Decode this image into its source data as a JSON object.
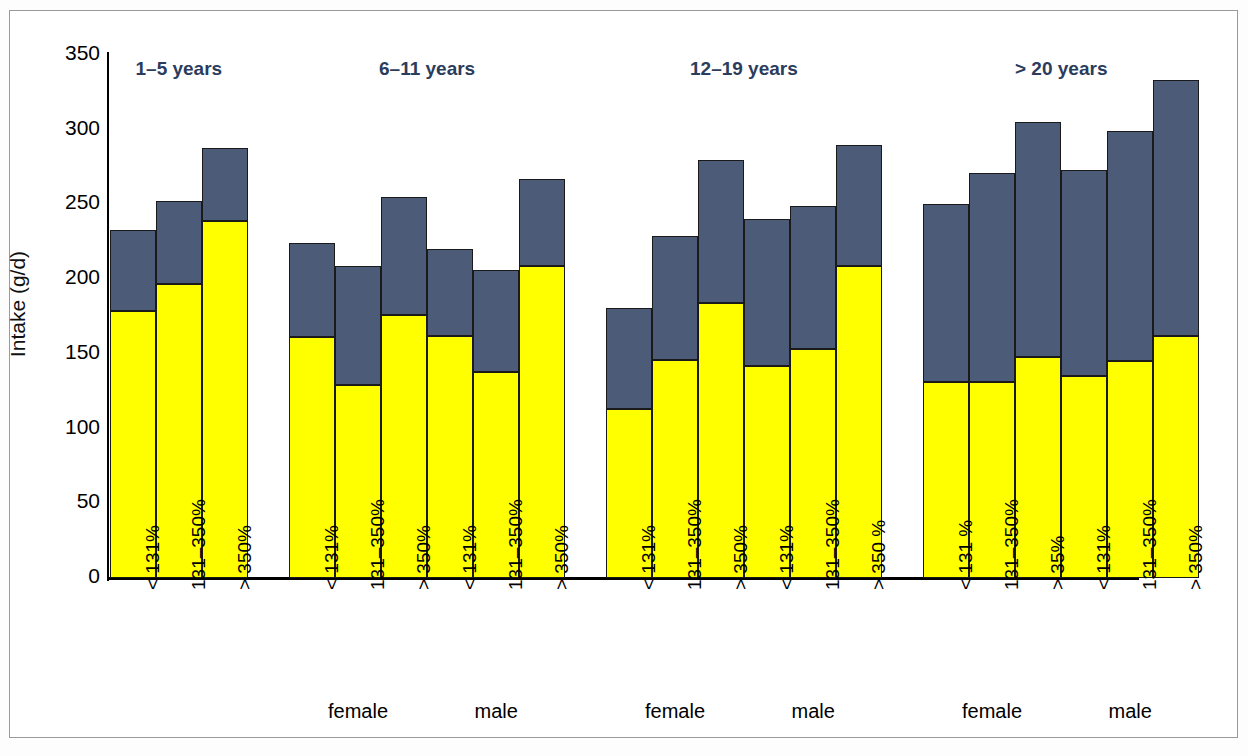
{
  "chart_data": {
    "type": "bar",
    "subtype": "stacked",
    "title": "",
    "xlabel": "",
    "ylabel": "Intake (g/d)",
    "ylim": [
      0,
      350
    ],
    "yticks": [
      0,
      50,
      100,
      150,
      200,
      250,
      300,
      350
    ],
    "grid": false,
    "legend": [],
    "colors": {
      "bottom_segment": "#ffff00",
      "top_segment": "#4c5c78",
      "outline": "#1a1a1a",
      "group_title": "#2b3c5c",
      "frame": "#9a9a9a"
    },
    "series": [
      {
        "name": "lower segment",
        "color": "#ffff00",
        "values": [
          179,
          197,
          239,
          161,
          129,
          176,
          162,
          138,
          209,
          113,
          146,
          184,
          142,
          153,
          209,
          131,
          131,
          148,
          135,
          145,
          162
        ]
      },
      {
        "name": "upper segment",
        "color": "#4c5c78",
        "values": [
          54,
          55,
          49,
          63,
          80,
          79,
          58,
          68,
          58,
          68,
          83,
          96,
          98,
          96,
          81,
          119,
          140,
          157,
          138,
          154,
          171
        ]
      }
    ],
    "totals": [
      233,
      252,
      288,
      224,
      209,
      255,
      220,
      206,
      267,
      181,
      229,
      280,
      240,
      249,
      290,
      250,
      271,
      305,
      273,
      299,
      333
    ],
    "categories": [
      "< 131%",
      "131–350%",
      "> 350%",
      "< 131%",
      "131–350%",
      "> 350%",
      "< 131%",
      "131–350%",
      "> 350%",
      "< 131%",
      "131–350%",
      "> 350%",
      "< 131%",
      "131–350%",
      "> 350 %",
      "< 131 %",
      "131–350%",
      "> 35%",
      "< 131%",
      "131–350%",
      "> 350%"
    ],
    "groups": [
      {
        "title": "1–5 years",
        "bar_indices": [
          0,
          1,
          2
        ],
        "sexes": []
      },
      {
        "title": "6–11 years",
        "bar_indices": [
          3,
          4,
          5,
          6,
          7,
          8
        ],
        "sexes": [
          "female",
          "male"
        ]
      },
      {
        "title": "12–19 years",
        "bar_indices": [
          9,
          10,
          11,
          12,
          13,
          14
        ],
        "sexes": [
          "female",
          "male"
        ]
      },
      {
        "title": "> 20 years",
        "bar_indices": [
          15,
          16,
          17,
          18,
          19,
          20
        ],
        "sexes": [
          "female",
          "male"
        ]
      }
    ]
  },
  "axis": {
    "y_title": "Intake (g/d)",
    "y_ticks": [
      "350",
      "300",
      "250",
      "200",
      "150",
      "100",
      "50",
      "0"
    ]
  },
  "group_titles": [
    "1–5 years",
    "6–11 years",
    "12–19 years",
    "> 20 years"
  ],
  "sex_labels": [
    "female",
    "male",
    "female",
    "male",
    "female",
    "male"
  ],
  "bar_labels": [
    "< 131%",
    "131–350%",
    "> 350%",
    "< 131%",
    "131–350%",
    "> 350%",
    "< 131%",
    "131–350%",
    "> 350%",
    "< 131%",
    "131–350%",
    "> 350%",
    "< 131%",
    "131–350%",
    "> 350 %",
    "< 131 %",
    "131–350%",
    "> 35%",
    "< 131%",
    "131–350%",
    "> 350%"
  ]
}
